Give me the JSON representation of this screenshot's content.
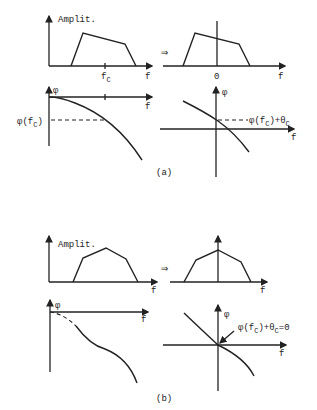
{
  "figure": {
    "panel_a": {
      "caption": "(a)",
      "amplitude_left": {
        "ylabel": "Amplit.",
        "xlabel": "f",
        "tick_label": "f",
        "tick_sub": "C"
      },
      "amplitude_right": {
        "xlabel": "f",
        "origin_label": "0"
      },
      "phase_left": {
        "ylabel": "φ",
        "xlabel": "f",
        "value_label": "φ(f",
        "value_sub": "C",
        "value_close": ")"
      },
      "phase_right": {
        "ylabel": "φ",
        "xlabel": "f",
        "annotation": "φ(f",
        "annotation_sub": "C",
        "annotation_mid": ")+θ",
        "annotation_sub2": "C"
      },
      "arrow": "⇒"
    },
    "panel_b": {
      "caption": "(b)",
      "amplitude_left": {
        "ylabel": "Amplit.",
        "xlabel": "f"
      },
      "amplitude_right": {
        "xlabel": "f"
      },
      "phase_left": {
        "ylabel": "φ",
        "xlabel": "f"
      },
      "phase_right": {
        "ylabel": "φ",
        "xlabel": "f",
        "annotation": "φ(f",
        "annotation_sub": "C",
        "annotation_mid": ")+θ",
        "annotation_sub2": "C",
        "annotation_end": "=0"
      },
      "arrow": "⇒"
    }
  }
}
